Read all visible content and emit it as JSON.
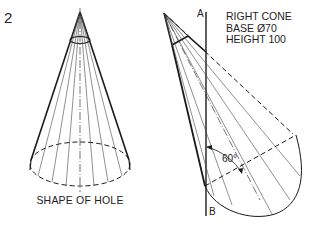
{
  "figure": {
    "number": "2",
    "left_view": {
      "caption": "SHAPE OF HOLE"
    },
    "right_view": {
      "spec_lines": [
        "RIGHT CONE",
        "BASE Ø70",
        "HEIGHT 100"
      ],
      "axis_top_label": "A",
      "axis_bottom_label": "B",
      "angle_label": "60°"
    },
    "colors": {
      "line": "#1a1a1a",
      "thin_line": "#444444",
      "background": "#ffffff"
    }
  }
}
